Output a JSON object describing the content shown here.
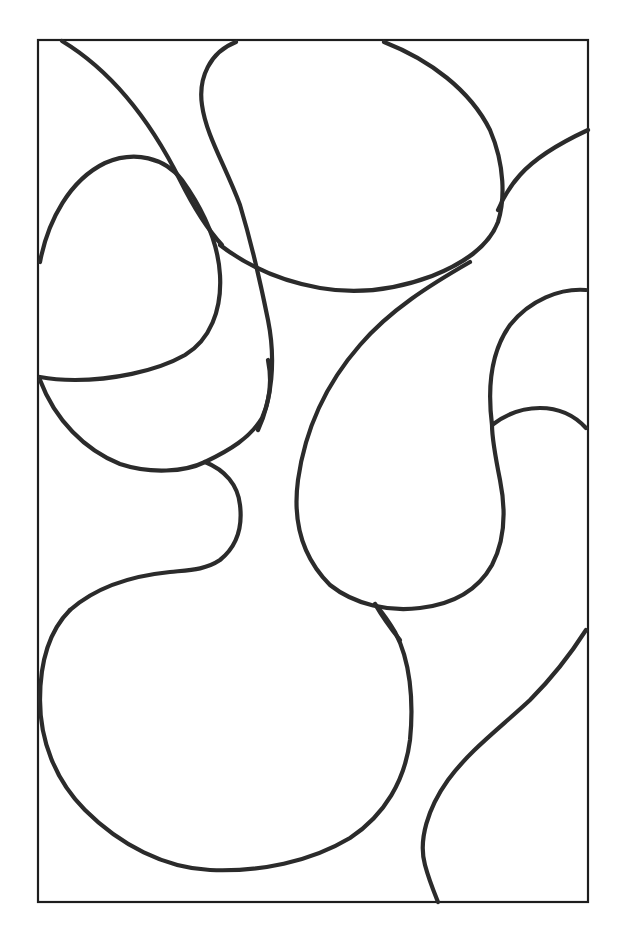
{
  "page": {
    "title": "Abstract blob coloring page",
    "canvas": {
      "width": 624,
      "height": 937,
      "background": "#ffffff"
    },
    "frame": {
      "x": 38,
      "y": 40,
      "width": 550,
      "height": 862,
      "stroke": "#1e1e1e"
    },
    "line_color": "#2b2b2b",
    "shapes": [
      {
        "name": "top-center-oval"
      },
      {
        "name": "top-left-diagonal-curve"
      },
      {
        "name": "left-upper-blob"
      },
      {
        "name": "left-middle-bulb"
      },
      {
        "name": "bottom-left-large-blob"
      },
      {
        "name": "center-right-teardrop"
      },
      {
        "name": "right-edge-lobe"
      },
      {
        "name": "bottom-right-s-curve"
      }
    ]
  }
}
